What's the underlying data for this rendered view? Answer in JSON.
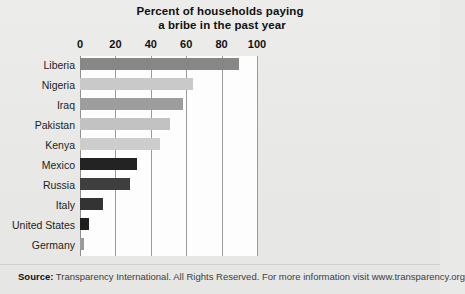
{
  "chart_data": {
    "type": "bar",
    "orientation": "horizontal",
    "title": "Percent of households paying a bribe in the past year",
    "title_line1": "Percent of households paying",
    "title_line2": "a bribe in the past year",
    "xlabel": "",
    "ylabel": "",
    "xlim": [
      0,
      100
    ],
    "grid": true,
    "legend": "none",
    "tick_labels": [
      "0",
      "20",
      "40",
      "60",
      "80",
      "100"
    ],
    "ticks": [
      0,
      20,
      40,
      60,
      80,
      100
    ],
    "categories": [
      "Liberia",
      "Nigeria",
      "Iraq",
      "Pakistan",
      "Kenya",
      "Mexico",
      "Russia",
      "Italy",
      "United States",
      "Germany"
    ],
    "values": [
      90,
      64,
      58,
      51,
      45,
      32,
      28,
      13,
      5,
      2
    ],
    "bar_colors": [
      "#878787",
      "#c9c9c9",
      "#9d9d9d",
      "#c2c2c2",
      "#cdcdcd",
      "#232323",
      "#3f3f3f",
      "#333333",
      "#1f1f1f",
      "#9b9b9b"
    ]
  },
  "footer": {
    "source_label": "Source:",
    "source_text": " Transparency International. All Rights Reserved. For more information visit www.transparency.org"
  },
  "colors": {
    "page_background": "#e9e9e7",
    "plot_background": "#fdfdfd",
    "gridline": "#9a9a9a",
    "axis": "#8d8d8d",
    "text": "#1b1b1b"
  }
}
